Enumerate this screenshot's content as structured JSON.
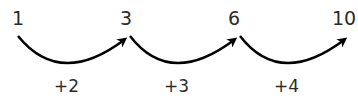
{
  "diagram": {
    "type": "number-sequence-jumps",
    "numbers": [
      "1",
      "3",
      "6",
      "10"
    ],
    "steps": [
      "+2",
      "+3",
      "+4"
    ],
    "arrow_color": "#000000",
    "text_color": "#2b2b2b"
  }
}
